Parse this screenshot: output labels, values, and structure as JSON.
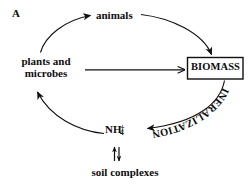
{
  "figure": {
    "panel_letter": "A",
    "background_color": "#ffffff",
    "ink_color": "#101010"
  },
  "nodes": {
    "animals": "animals",
    "plants_and_microbes_line1": "plants and",
    "plants_and_microbes_line2": "microbes",
    "biomass": "BIOMASS",
    "ammonium_base": "NH",
    "ammonium_subscript": "4",
    "ammonium_superscript": "+",
    "soil_complexes": "soil complexes"
  },
  "arrow_labels": {
    "mineralization": "MINERALIZATION"
  },
  "edges": [
    {
      "name": "plants-to-animals",
      "from": "plants and microbes",
      "to": "animals",
      "style": "curved-arrow"
    },
    {
      "name": "animals-to-biomass",
      "from": "animals",
      "to": "BIOMASS",
      "style": "curved-arrow"
    },
    {
      "name": "plants-to-biomass",
      "from": "plants and microbes",
      "to": "BIOMASS",
      "style": "straight-arrow"
    },
    {
      "name": "biomass-to-ammonium",
      "from": "BIOMASS",
      "to": "NH4+",
      "style": "curved-arrow",
      "label": "MINERALIZATION"
    },
    {
      "name": "ammonium-to-plants",
      "from": "NH4+",
      "to": "plants and microbes",
      "style": "curved-arrow"
    },
    {
      "name": "ammonium-soil-equilibrium",
      "from": "NH4+",
      "to": "soil complexes",
      "style": "double-headed-vertical-arrow"
    }
  ]
}
